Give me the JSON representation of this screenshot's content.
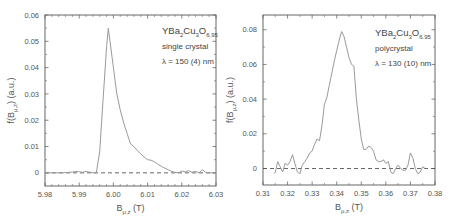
{
  "chart_data": [
    {
      "type": "line",
      "title": "",
      "annotation": {
        "formula": {
          "base": "YBa",
          "s1": "2",
          "mid": "Cu",
          "s2": "3",
          "o": "O",
          "s3": "6.95"
        },
        "line2": "single crystal",
        "line3": "λ = 150 (4) nm"
      },
      "xlabel": {
        "main": "B",
        "sub": "μ,z",
        "unit": " (T)"
      },
      "ylabel": {
        "main": "f(B",
        "sub": "μ,z",
        "unit": ") (a.u.)"
      },
      "xlim": [
        5.98,
        6.03
      ],
      "ylim": [
        -0.005,
        0.06
      ],
      "xticks": [
        "5.98",
        "5.99",
        "6.00",
        "6.01",
        "6.02",
        "6.03"
      ],
      "yticks": [
        "0",
        "0.01",
        "0.02",
        "0.03",
        "0.04",
        "0.05",
        "0.06"
      ],
      "grid": false,
      "baseline": {
        "y": 0,
        "style": "dashed"
      },
      "series": [
        {
          "name": "single crystal",
          "x": [
            5.98,
            5.985,
            5.988,
            5.989,
            5.99,
            5.991,
            5.992,
            5.993,
            5.994,
            5.995,
            5.996,
            5.997,
            5.998,
            5.9985,
            5.999,
            6.0,
            6.001,
            6.002,
            6.003,
            6.004,
            6.005,
            6.006,
            6.007,
            6.008,
            6.009,
            6.01,
            6.011,
            6.012,
            6.013,
            6.014,
            6.015,
            6.016,
            6.017,
            6.018,
            6.019,
            6.02,
            6.021,
            6.022,
            6.023,
            6.024,
            6.025,
            6.026,
            6.027,
            6.028,
            6.03
          ],
          "y": [
            0,
            0,
            0.0003,
            0.0006,
            0.0004,
            0.0002,
            0.0005,
            0.0003,
            0,
            0,
            0.008,
            0.028,
            0.048,
            0.055,
            0.05,
            0.04,
            0.03,
            0.024,
            0.019,
            0.015,
            0.011,
            0.01,
            0.0085,
            0.0072,
            0.006,
            0.005,
            0.0048,
            0.0042,
            0.0033,
            0.0025,
            0.0018,
            0.0012,
            0.0006,
            0.0002,
            0,
            0.0007,
            0.0004,
            0.0008,
            0.0002,
            0.0006,
            0,
            0.0012,
            0.0002,
            0,
            0
          ]
        }
      ]
    },
    {
      "type": "line",
      "title": "",
      "annotation": {
        "formula": {
          "base": "YBa",
          "s1": "2",
          "mid": "Cu",
          "s2": "3",
          "o": "O",
          "s3": "6.95"
        },
        "line2": "polycrystal",
        "line3": "λ = 130 (10) nm"
      },
      "xlabel": {
        "main": "B",
        "sub": "μ,z",
        "unit": " (T)"
      },
      "ylabel": {
        "main": "f(B",
        "sub": "μ,z",
        "unit": ") (a.u.)"
      },
      "xlim": [
        0.31,
        0.38
      ],
      "ylim": [
        -0.0095,
        0.0885
      ],
      "xticks": [
        "0.31",
        "0.32",
        "0.33",
        "0.34",
        "0.35",
        "0.36",
        "0.37",
        "0.38"
      ],
      "yticks": [
        "0",
        "0.02",
        "0.04",
        "0.06",
        "0.08"
      ],
      "grid": false,
      "baseline": {
        "y": 0,
        "style": "dashed"
      },
      "series": [
        {
          "name": "polycrystal",
          "x": [
            0.3145,
            0.315,
            0.316,
            0.317,
            0.318,
            0.319,
            0.32,
            0.321,
            0.322,
            0.323,
            0.324,
            0.325,
            0.326,
            0.327,
            0.328,
            0.329,
            0.33,
            0.331,
            0.332,
            0.333,
            0.334,
            0.335,
            0.336,
            0.337,
            0.338,
            0.339,
            0.34,
            0.341,
            0.342,
            0.343,
            0.344,
            0.345,
            0.346,
            0.347,
            0.348,
            0.349,
            0.35,
            0.351,
            0.352,
            0.353,
            0.354,
            0.355,
            0.356,
            0.357,
            0.358,
            0.359,
            0.36,
            0.361,
            0.362,
            0.363,
            0.364,
            0.365,
            0.366,
            0.367,
            0.368,
            0.369,
            0.37,
            0.371,
            0.372,
            0.373,
            0.374,
            0.375,
            0.376
          ],
          "y": [
            -0.003,
            -0.002,
            0.004,
            0.001,
            -0.002,
            0.003,
            0.002,
            0.004,
            0.008,
            0.003,
            -0.002,
            -0.003,
            0.002,
            0.004,
            0.006,
            0.009,
            0.01,
            0.014,
            0.017,
            0.016,
            0.025,
            0.037,
            0.041,
            0.048,
            0.055,
            0.062,
            0.068,
            0.074,
            0.079,
            0.076,
            0.07,
            0.064,
            0.06,
            0.059,
            0.04,
            0.028,
            0.017,
            0.011,
            0.011,
            0.013,
            0.012,
            0.01,
            0.005,
            0.004,
            0.004,
            0.005,
            0.003,
            0.004,
            -0.002,
            -0.003,
            0.0,
            0.002,
            0.0,
            -0.001,
            -0.001,
            0.002,
            0.009,
            0.006,
            0.0,
            -0.003,
            -0.002,
            0.001,
            0.0
          ]
        }
      ]
    }
  ]
}
